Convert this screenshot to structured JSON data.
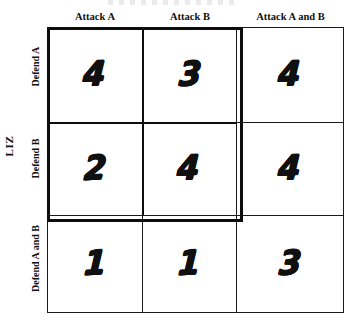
{
  "page": {
    "background_color": "#ffffff",
    "ink_color": "#111111",
    "width": 347,
    "height": 324
  },
  "title_sliver": {
    "visible_text": "",
    "note": "cropped illegible text sliver at top edge"
  },
  "axis": {
    "row_axis_label": "LIZ"
  },
  "matrix": {
    "column_headers": [
      "Attack A",
      "Attack B",
      "Attack A and B"
    ],
    "row_headers": [
      "Defend A",
      "Defend B",
      "Defend A and B"
    ],
    "rows": [
      {
        "label": "Defend A",
        "values": [
          "4",
          "3",
          "4"
        ]
      },
      {
        "label": "Defend B",
        "values": [
          "2",
          "4",
          "4"
        ]
      },
      {
        "label": "Defend A and B",
        "values": [
          "1",
          "1",
          "3"
        ]
      }
    ],
    "emphasis_block": {
      "description": "thick border around upper-left 2x2 sub-matrix",
      "rows": [
        "Defend A",
        "Defend B"
      ],
      "columns": [
        "Attack A",
        "Attack B"
      ],
      "border_color": "#0d0d0d"
    }
  },
  "chart_data": {
    "type": "table",
    "title": "",
    "xlabel": "",
    "ylabel": "LIZ",
    "categories": [
      "Attack A",
      "Attack B",
      "Attack A and B"
    ],
    "row_categories": [
      "Defend A",
      "Defend B",
      "Defend A and B"
    ],
    "series": [
      {
        "name": "Defend A",
        "values": [
          4,
          3,
          4
        ]
      },
      {
        "name": "Defend B",
        "values": [
          2,
          4,
          4
        ]
      },
      {
        "name": "Defend A and B",
        "values": [
          1,
          1,
          3
        ]
      }
    ],
    "grid": true,
    "legend": "none"
  }
}
